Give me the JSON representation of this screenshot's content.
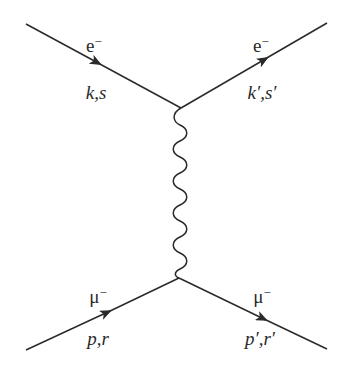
{
  "diagram": {
    "type": "feynman-diagram",
    "colors": {
      "line": "#2a2a2a",
      "background": "#ffffff"
    },
    "vertices": [
      {
        "id": "top",
        "x": 181,
        "y": 108
      },
      {
        "id": "bottom",
        "x": 179,
        "y": 278
      }
    ],
    "particles": {
      "incoming_electron": {
        "name": "e",
        "charge": "−",
        "momentum_label": "k,s",
        "from": [
          26,
          24
        ],
        "to": "top"
      },
      "outgoing_electron": {
        "name": "e",
        "charge": "−",
        "momentum_label": "k′,s′",
        "from": "top",
        "to": [
          327,
          23
        ]
      },
      "incoming_muon": {
        "name": "μ",
        "charge": "−",
        "momentum_label": "p,r",
        "from": [
          26,
          350
        ],
        "to": "bottom"
      },
      "outgoing_muon": {
        "name": "μ",
        "charge": "−",
        "momentum_label": "p′,r′",
        "from": "bottom",
        "to": [
          327,
          349
        ]
      },
      "photon": {
        "name": "γ",
        "style": "wavy",
        "from": "top",
        "to": "bottom",
        "wiggles": 7
      }
    }
  }
}
